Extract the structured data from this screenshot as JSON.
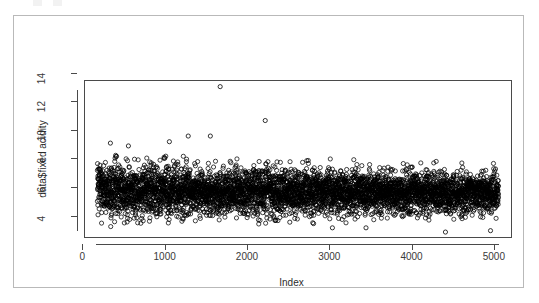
{
  "figure": {
    "background_color": "#ffffff",
    "frame_color": "#b9b9b9",
    "panel_border_color": "#4a4a4a",
    "marker_color": "#000000",
    "marker_symbol": "open-circle"
  },
  "axes": {
    "y_title": "data$fixed acidity",
    "x_title": "Index",
    "y_ticks": [
      "4",
      "6",
      "8",
      "10",
      "12",
      "14"
    ],
    "x_ticks": [
      "0",
      "1000",
      "2000",
      "3000",
      "4000",
      "5000"
    ]
  },
  "chart_data": {
    "type": "scatter",
    "title": "",
    "xlabel": "Index",
    "ylabel": "data$fixed acidity",
    "xlim": [
      -150,
      5050
    ],
    "ylim": [
      3.55,
      14.6
    ],
    "grid": false,
    "legend": null,
    "marker": "open-circle",
    "marker_color": "#000000",
    "marker_size_px": 3.1,
    "n_points": 4898,
    "x_tick_values": [
      0,
      1000,
      2000,
      3000,
      4000,
      5000
    ],
    "y_tick_values": [
      4,
      6,
      8,
      10,
      12,
      14
    ],
    "series": [
      {
        "name": "fixed acidity",
        "x_range": [
          1,
          4898
        ],
        "y_mean": 6.85,
        "y_sd": 0.84,
        "y_min": 3.8,
        "y_max": 14.2,
        "y_quartiles": [
          6.3,
          6.8,
          7.3
        ],
        "dense_band": [
          5.9,
          8.0
        ],
        "notable_outliers": [
          {
            "index": 1500,
            "value": 14.2
          },
          {
            "index": 2050,
            "value": 11.8
          },
          {
            "index": 1110,
            "value": 10.7
          },
          {
            "index": 1380,
            "value": 10.7
          },
          {
            "index": 880,
            "value": 10.3
          },
          {
            "index": 160,
            "value": 10.2
          },
          {
            "index": 380,
            "value": 10.0
          },
          {
            "index": 2870,
            "value": 4.2
          },
          {
            "index": 3280,
            "value": 4.2
          },
          {
            "index": 4250,
            "value": 3.9
          },
          {
            "index": 4800,
            "value": 4.0
          },
          {
            "index": 2350,
            "value": 4.6
          },
          {
            "index": 2640,
            "value": 4.5
          }
        ]
      }
    ]
  }
}
